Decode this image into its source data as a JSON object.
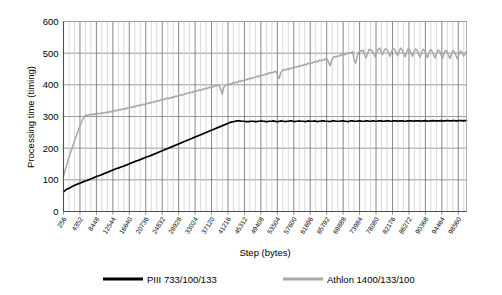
{
  "chart_data": {
    "type": "line",
    "title": "",
    "xlabel": "Step (bytes)",
    "ylabel": "Processing time (timing)",
    "ylim": [
      0,
      600
    ],
    "ytick_values": [
      0,
      100,
      200,
      300,
      400,
      500,
      600
    ],
    "ytick_labels": [
      "0",
      "100",
      "200",
      "300",
      "400",
      "500",
      "600"
    ],
    "grid": true,
    "legend_position": "bottom",
    "x_tick_labels": [
      "256",
      "4352",
      "8448",
      "12544",
      "16640",
      "20736",
      "24832",
      "28928",
      "33024",
      "37120",
      "41216",
      "45312",
      "49408",
      "53504",
      "57600",
      "61696",
      "65792",
      "69888",
      "73984",
      "78080",
      "82176",
      "86272",
      "90368",
      "94464",
      "98560"
    ],
    "x_tick_values": [
      256,
      4352,
      8448,
      12544,
      16640,
      20736,
      24832,
      28928,
      33024,
      37120,
      41216,
      45312,
      49408,
      53504,
      57600,
      61696,
      65792,
      69888,
      73984,
      78080,
      82176,
      86272,
      90368,
      94464,
      98560
    ],
    "x_tick_step": 4096,
    "xlim": [
      256,
      100608
    ],
    "series": [
      {
        "name": "PIII 733/100/133",
        "color": "#000000",
        "values": [
          62,
          66,
          70,
          72,
          74,
          77,
          80,
          82,
          84,
          86,
          88,
          90,
          92,
          94,
          96,
          97,
          99,
          101,
          103,
          105,
          107,
          109,
          111,
          113,
          114,
          116,
          118,
          120,
          122,
          124,
          126,
          128,
          130,
          132,
          134,
          136,
          137,
          139,
          141,
          142,
          144,
          146,
          148,
          150,
          152,
          154,
          156,
          158,
          160,
          161,
          163,
          165,
          167,
          169,
          171,
          173,
          174,
          176,
          178,
          180,
          182,
          184,
          186,
          188,
          190,
          192,
          194,
          196,
          198,
          200,
          202,
          204,
          206,
          208,
          210,
          212,
          214,
          216,
          218,
          220,
          222,
          224,
          226,
          228,
          230,
          232,
          234,
          236,
          238,
          240,
          242,
          244,
          246,
          248,
          250,
          252,
          254,
          256,
          258,
          260,
          262,
          264,
          266,
          268,
          270,
          272,
          274,
          276,
          278,
          280,
          282,
          283,
          284,
          285,
          286,
          286,
          286,
          285,
          285,
          285,
          284,
          284,
          284,
          285,
          285,
          285,
          284,
          284,
          285,
          285,
          286,
          285,
          285,
          284,
          284,
          285,
          285,
          285,
          286,
          285,
          284,
          284,
          285,
          286,
          285,
          285,
          284,
          285,
          285,
          286,
          286,
          285,
          284,
          285,
          285,
          286,
          285,
          285,
          285,
          284,
          285,
          286,
          285,
          285,
          285,
          286,
          285,
          284,
          285,
          285,
          286,
          286,
          285,
          285,
          285,
          284,
          285,
          286,
          286,
          285,
          285,
          285,
          285,
          286,
          286,
          285,
          285,
          284,
          285,
          286,
          286,
          285,
          285,
          285,
          286,
          286,
          285,
          285,
          285,
          286,
          286,
          285,
          285,
          286,
          286,
          285,
          285,
          286,
          286,
          286,
          285,
          285,
          286,
          286,
          286,
          285,
          285,
          286,
          286,
          286,
          285,
          286,
          286,
          286,
          285,
          285,
          286,
          286,
          286,
          286,
          285,
          286,
          286,
          286,
          286,
          285,
          286,
          286,
          287,
          286,
          285,
          286,
          286,
          287,
          286,
          286,
          286,
          286,
          287,
          286,
          286,
          286,
          287,
          287,
          286,
          286,
          287,
          287,
          286,
          286,
          287,
          287,
          287,
          286,
          287,
          287
        ]
      },
      {
        "name": "Athlon 1400/133/100",
        "color": "#a8a8a8",
        "values": [
          112,
          128,
          145,
          160,
          176,
          190,
          204,
          218,
          232,
          245,
          258,
          270,
          282,
          292,
          300,
          305,
          303,
          307,
          304,
          308,
          305,
          309,
          306,
          310,
          308,
          312,
          309,
          313,
          311,
          315,
          312,
          316,
          314,
          318,
          316,
          320,
          318,
          322,
          320,
          324,
          322,
          326,
          324,
          328,
          326,
          330,
          328,
          332,
          331,
          335,
          333,
          337,
          335,
          339,
          337,
          341,
          340,
          344,
          342,
          346,
          344,
          348,
          347,
          351,
          349,
          353,
          351,
          355,
          354,
          358,
          356,
          360,
          358,
          362,
          361,
          365,
          363,
          367,
          366,
          370,
          368,
          372,
          371,
          375,
          373,
          377,
          376,
          380,
          378,
          382,
          381,
          385,
          383,
          387,
          386,
          390,
          388,
          392,
          391,
          395,
          393,
          397,
          396,
          400,
          398,
          385,
          370,
          392,
          398,
          402,
          400,
          404,
          402,
          407,
          405,
          409,
          407,
          412,
          410,
          414,
          412,
          417,
          415,
          419,
          418,
          422,
          420,
          424,
          423,
          427,
          425,
          430,
          428,
          432,
          431,
          435,
          433,
          438,
          436,
          440,
          438,
          443,
          441,
          430,
          420,
          438,
          445,
          448,
          446,
          450,
          448,
          452,
          451,
          455,
          453,
          457,
          456,
          460,
          458,
          462,
          461,
          465,
          463,
          468,
          466,
          470,
          468,
          473,
          471,
          475,
          473,
          478,
          476,
          480,
          478,
          483,
          481,
          470,
          460,
          478,
          486,
          490,
          488,
          492,
          490,
          495,
          493,
          497,
          495,
          500,
          498,
          502,
          500,
          505,
          478,
          468,
          490,
          503,
          508,
          506,
          510,
          495,
          485,
          500,
          512,
          510,
          508,
          498,
          488,
          502,
          512,
          516,
          505,
          495,
          508,
          514,
          510,
          500,
          490,
          505,
          515,
          512,
          502,
          492,
          506,
          516,
          510,
          498,
          488,
          503,
          514,
          511,
          500,
          490,
          505,
          513,
          509,
          497,
          487,
          502,
          512,
          508,
          496,
          486,
          501,
          511,
          507,
          495,
          485,
          500,
          510,
          506,
          494,
          484,
          499,
          509,
          505,
          493,
          483,
          498,
          508,
          504,
          492,
          482,
          497,
          507,
          503,
          491,
          498,
          505
        ]
      }
    ]
  },
  "legend": {
    "entries": [
      {
        "label": "PIII 733/100/133",
        "color": "#000000"
      },
      {
        "label": "Athlon 1400/133/100",
        "color": "#a8a8a8"
      }
    ]
  }
}
